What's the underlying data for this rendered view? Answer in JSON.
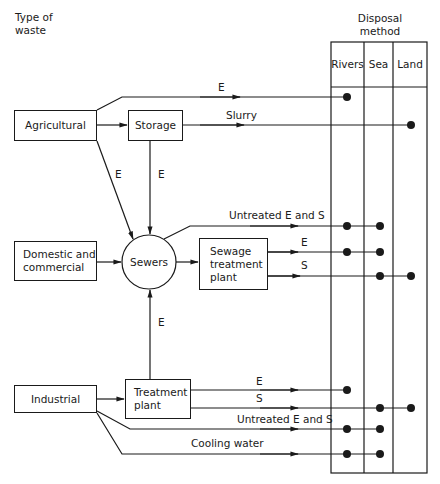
{
  "headings": {
    "type_of_waste": [
      "Type of",
      "waste"
    ],
    "disposal_method": [
      "Disposal",
      "method"
    ]
  },
  "disposal_columns": [
    "Rivers",
    "Sea",
    "Land"
  ],
  "sources": {
    "agricultural": "Agricultural",
    "domestic": [
      "Domestic and",
      "commercial"
    ],
    "industrial": "Industrial"
  },
  "processes": {
    "storage": "Storage",
    "sewers": "Sewers",
    "sewage_plant": [
      "Sewage",
      "treatment",
      "plant"
    ],
    "treatment_plant": [
      "Treatment",
      "plant"
    ]
  },
  "flow_labels": {
    "agri_e": "E",
    "slurry": "Slurry",
    "agri_to_sewers_e": "E",
    "storage_to_sewers_e": "E",
    "sewers_untreated": "Untreated E and S",
    "sewage_e": "E",
    "sewage_s": "S",
    "treatment_to_sewers_e": "E",
    "treatment_e": "E",
    "treatment_s": "S",
    "industrial_untreated": "Untreated E and S",
    "cooling": "Cooling water"
  },
  "flows": [
    {
      "from": "Agricultural",
      "label": "E",
      "destinations": [
        "Rivers"
      ]
    },
    {
      "from": "Storage",
      "label": "Slurry",
      "destinations": [
        "Land"
      ]
    },
    {
      "from": "Agricultural",
      "to": "Sewers",
      "label": "E"
    },
    {
      "from": "Agricultural",
      "to": "Storage",
      "label": ""
    },
    {
      "from": "Storage",
      "to": "Sewers",
      "label": "E"
    },
    {
      "from": "Domestic and commercial",
      "to": "Sewers",
      "label": ""
    },
    {
      "from": "Sewers",
      "label": "Untreated E and S",
      "destinations": [
        "Rivers",
        "Sea"
      ]
    },
    {
      "from": "Sewers",
      "to": "Sewage treatment plant",
      "label": ""
    },
    {
      "from": "Sewage treatment plant",
      "label": "E",
      "destinations": [
        "Rivers",
        "Sea"
      ]
    },
    {
      "from": "Sewage treatment plant",
      "label": "S",
      "destinations": [
        "Sea",
        "Land"
      ]
    },
    {
      "from": "Treatment plant",
      "to": "Sewers",
      "label": "E"
    },
    {
      "from": "Industrial",
      "to": "Treatment plant",
      "label": ""
    },
    {
      "from": "Treatment plant",
      "label": "E",
      "destinations": [
        "Rivers"
      ]
    },
    {
      "from": "Treatment plant",
      "label": "S",
      "destinations": [
        "Sea",
        "Land"
      ]
    },
    {
      "from": "Industrial",
      "label": "Untreated E and S",
      "destinations": [
        "Rivers",
        "Sea"
      ]
    },
    {
      "from": "Industrial",
      "label": "Cooling water",
      "destinations": [
        "Rivers",
        "Sea"
      ]
    }
  ],
  "colors": {
    "ink": "#1a1a1a",
    "background": "#ffffff"
  }
}
